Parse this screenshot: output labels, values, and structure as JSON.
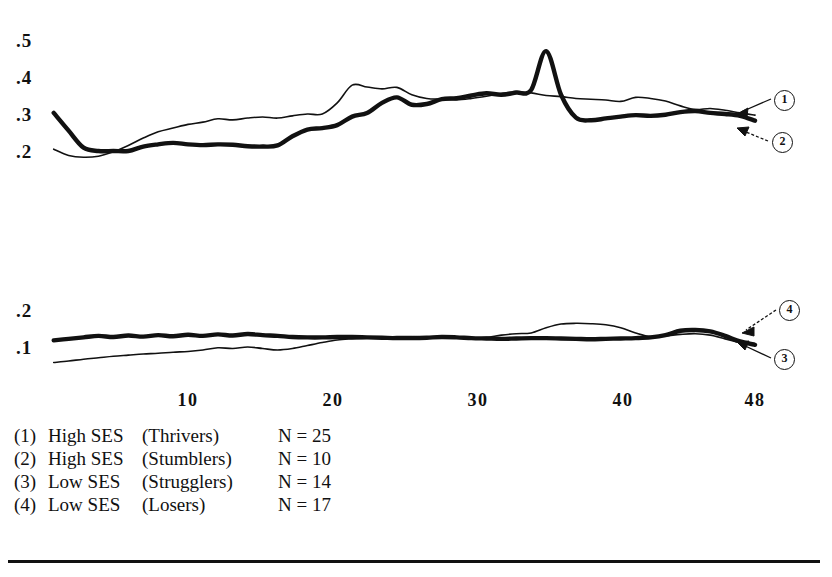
{
  "chart_data": {
    "type": "line",
    "title": "",
    "subtitle": "",
    "xlabel": "",
    "ylabel": "",
    "grid": false,
    "legend_position": "below-plot",
    "panels": [
      {
        "name": "upper-panel",
        "ylim": [
          0.15,
          0.55
        ],
        "yticks": [
          0.5,
          0.4,
          0.3,
          0.2
        ],
        "ytick_labels": [
          ".5",
          ".4",
          ".3",
          ".2"
        ],
        "xlim": [
          1,
          48
        ],
        "series": [
          {
            "name": "High SES (Thrivers)",
            "callout": "1",
            "style": "thin",
            "x": [
              1,
              2,
              3,
              4,
              5,
              6,
              7,
              8,
              9,
              10,
              11,
              12,
              13,
              14,
              15,
              16,
              17,
              18,
              19,
              20,
              21,
              22,
              23,
              24,
              25,
              26,
              27,
              28,
              29,
              30,
              31,
              32,
              33,
              34,
              35,
              36,
              37,
              38,
              39,
              40,
              41,
              42,
              43,
              44,
              45,
              46,
              47,
              48
            ],
            "values": [
              0.205,
              0.188,
              0.183,
              0.186,
              0.198,
              0.215,
              0.235,
              0.252,
              0.262,
              0.272,
              0.278,
              0.287,
              0.284,
              0.289,
              0.292,
              0.289,
              0.295,
              0.3,
              0.3,
              0.33,
              0.378,
              0.373,
              0.368,
              0.372,
              0.352,
              0.342,
              0.34,
              0.338,
              0.342,
              0.348,
              0.355,
              0.36,
              0.357,
              0.35,
              0.347,
              0.342,
              0.34,
              0.338,
              0.334,
              0.345,
              0.342,
              0.335,
              0.322,
              0.312,
              0.315,
              0.31,
              0.303,
              0.297
            ]
          },
          {
            "name": "High SES (Stumblers)",
            "callout": "2",
            "style": "bold",
            "x": [
              1,
              2,
              3,
              4,
              5,
              6,
              7,
              8,
              9,
              10,
              11,
              12,
              13,
              14,
              15,
              16,
              17,
              18,
              19,
              20,
              21,
              22,
              23,
              24,
              25,
              26,
              27,
              28,
              29,
              30,
              31,
              32,
              33,
              34,
              35,
              36,
              37,
              38,
              39,
              40,
              41,
              42,
              43,
              44,
              45,
              46,
              47,
              48
            ],
            "values": [
              0.303,
              0.255,
              0.209,
              0.2,
              0.2,
              0.2,
              0.212,
              0.218,
              0.222,
              0.218,
              0.216,
              0.218,
              0.217,
              0.213,
              0.212,
              0.215,
              0.24,
              0.258,
              0.262,
              0.27,
              0.293,
              0.303,
              0.33,
              0.345,
              0.325,
              0.327,
              0.34,
              0.343,
              0.35,
              0.356,
              0.352,
              0.358,
              0.365,
              0.47,
              0.352,
              0.29,
              0.283,
              0.288,
              0.293,
              0.297,
              0.295,
              0.298,
              0.305,
              0.308,
              0.303,
              0.3,
              0.295,
              0.282
            ]
          }
        ],
        "callouts": [
          {
            "label": "1",
            "points_to": "thin-line-end"
          },
          {
            "label": "2",
            "points_to": "bold-line-end"
          }
        ]
      },
      {
        "name": "lower-panel",
        "ylim": [
          0.03,
          0.23
        ],
        "yticks": [
          0.2,
          0.1
        ],
        "ytick_labels": [
          ".2",
          ".1"
        ],
        "xlim": [
          1,
          48
        ],
        "series": [
          {
            "name": "Low SES (Strugglers)",
            "callout": "3",
            "style": "thin",
            "x": [
              1,
              2,
              3,
              4,
              5,
              6,
              7,
              8,
              9,
              10,
              11,
              12,
              13,
              14,
              15,
              16,
              17,
              18,
              19,
              20,
              21,
              22,
              23,
              24,
              25,
              26,
              27,
              28,
              29,
              30,
              31,
              32,
              33,
              34,
              35,
              36,
              37,
              38,
              39,
              40,
              41,
              42,
              43,
              44,
              45,
              46,
              47,
              48
            ],
            "values": [
              0.058,
              0.062,
              0.067,
              0.071,
              0.075,
              0.078,
              0.081,
              0.083,
              0.086,
              0.088,
              0.092,
              0.098,
              0.096,
              0.1,
              0.096,
              0.092,
              0.096,
              0.104,
              0.112,
              0.119,
              0.122,
              0.124,
              0.126,
              0.128,
              0.128,
              0.127,
              0.125,
              0.124,
              0.123,
              0.126,
              0.132,
              0.136,
              0.138,
              0.152,
              0.162,
              0.164,
              0.163,
              0.16,
              0.152,
              0.138,
              0.128,
              0.13,
              0.134,
              0.136,
              0.132,
              0.122,
              0.112,
              0.104
            ]
          },
          {
            "name": "Low SES (Losers)",
            "callout": "4",
            "style": "bold",
            "x": [
              1,
              2,
              3,
              4,
              5,
              6,
              7,
              8,
              9,
              10,
              11,
              12,
              13,
              14,
              15,
              16,
              17,
              18,
              19,
              20,
              21,
              22,
              23,
              24,
              25,
              26,
              27,
              28,
              29,
              30,
              31,
              32,
              33,
              34,
              35,
              36,
              37,
              38,
              39,
              40,
              41,
              42,
              43,
              44,
              45,
              46,
              47,
              48
            ],
            "values": [
              0.118,
              0.122,
              0.126,
              0.13,
              0.127,
              0.131,
              0.128,
              0.132,
              0.129,
              0.133,
              0.13,
              0.134,
              0.131,
              0.135,
              0.132,
              0.13,
              0.127,
              0.126,
              0.126,
              0.127,
              0.127,
              0.126,
              0.125,
              0.124,
              0.124,
              0.125,
              0.127,
              0.126,
              0.124,
              0.123,
              0.122,
              0.123,
              0.124,
              0.124,
              0.123,
              0.122,
              0.121,
              0.122,
              0.123,
              0.124,
              0.126,
              0.132,
              0.144,
              0.146,
              0.142,
              0.13,
              0.115,
              0.106
            ]
          }
        ],
        "callouts": [
          {
            "label": "4",
            "points_to": "bold-line-end"
          },
          {
            "label": "3",
            "points_to": "thin-line-end"
          }
        ]
      }
    ],
    "xticks": [
      10,
      20,
      30,
      40,
      48
    ],
    "xtick_labels": [
      "10",
      "20",
      "30",
      "40",
      "48"
    ]
  },
  "axis": {
    "upper_y_labels": [
      ".5",
      ".4",
      ".3",
      ".2"
    ],
    "lower_y_labels": [
      ".2",
      ".1"
    ],
    "x_labels": [
      "10",
      "20",
      "30",
      "40",
      "48"
    ]
  },
  "callouts": {
    "one": "1",
    "two": "2",
    "three": "3",
    "four": "4"
  },
  "legend": {
    "rows": [
      {
        "num": "(1)",
        "ses": "High SES",
        "group": "(Thrivers)",
        "n": "N = 25"
      },
      {
        "num": "(2)",
        "ses": "High SES",
        "group": "(Stumblers)",
        "n": "N = 10"
      },
      {
        "num": "(3)",
        "ses": "Low SES",
        "group": "(Strugglers)",
        "n": "N = 14"
      },
      {
        "num": "(4)",
        "ses": "Low SES",
        "group": "(Losers)",
        "n": "N = 17"
      }
    ]
  },
  "colors": {
    "ink": "#111111",
    "background": "#ffffff"
  }
}
